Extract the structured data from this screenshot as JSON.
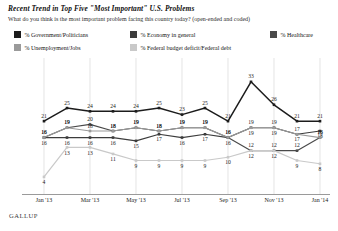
{
  "header": {
    "title": "Recent Trend in Top Five \"Most Important\" U.S. Problems",
    "subtitle": "What do you think is the most important problem facing this country today? (open-ended and coded)"
  },
  "brand": "GALLUP",
  "legend": [
    {
      "label": "% Government/Politicians",
      "color": "#1c1c1c"
    },
    {
      "label": "% Economy in general",
      "color": "#3c3c3c"
    },
    {
      "label": "% Healthcare",
      "color": "#4a4a4a"
    },
    {
      "label": "% Unemployment/Jobs",
      "color": "#9a9a9a"
    },
    {
      "label": "% Federal budget deficit/Federal debt",
      "color": "#c9c9c9"
    }
  ],
  "chart_data": {
    "type": "line",
    "title": "Recent Trend in Top Five \"Most Important\" U.S. Problems",
    "subtitle": "What do you think is the most important problem facing this country today? (open-ended and coded)",
    "xlabel": "",
    "ylabel": "",
    "ylim": [
      0,
      36
    ],
    "grid": "vertical",
    "legend_position": "top",
    "x": [
      "Jan '13",
      "Feb '13",
      "Mar '13",
      "Apr '13",
      "May '13",
      "Jun '13",
      "Jul '13",
      "Aug '13",
      "Sep '13",
      "Oct '13",
      "Nov '13",
      "Dec '13",
      "Jan '14"
    ],
    "xtick_labels": [
      "Jan '13",
      "Mar '13",
      "May '13",
      "Jul '13",
      "Sep '13",
      "Nov '13",
      "Jan '14"
    ],
    "xtick_index": [
      0,
      2,
      4,
      6,
      8,
      10,
      12
    ],
    "series": [
      {
        "name": "% Government/Politicians",
        "color": "#1c1c1c",
        "values": [
          21,
          25,
          24,
          24,
          24,
          25,
          23,
          25,
          21,
          33,
          26,
          21,
          21
        ]
      },
      {
        "name": "% Economy in general",
        "color": "#3c3c3c",
        "values": [
          16,
          16,
          16,
          16,
          15,
          17,
          16,
          17,
          16,
          19,
          19,
          17,
          18
        ]
      },
      {
        "name": "% Healthcare",
        "color": "#4a4a4a",
        "values": [
          16,
          19,
          20,
          18,
          19,
          18,
          19,
          19,
          16,
          12,
          12,
          12,
          16
        ]
      },
      {
        "name": "% Unemployment/Jobs",
        "color": "#9a9a9a",
        "values": [
          16,
          19,
          18,
          18,
          19,
          18,
          19,
          19,
          16,
          19,
          19,
          17,
          16
        ]
      },
      {
        "name": "% Federal budget deficit/Federal debt",
        "color": "#c9c9c9",
        "values": [
          4,
          13,
          13,
          11,
          9,
          9,
          9,
          9,
          10,
          12,
          12,
          9,
          8
        ]
      }
    ]
  }
}
